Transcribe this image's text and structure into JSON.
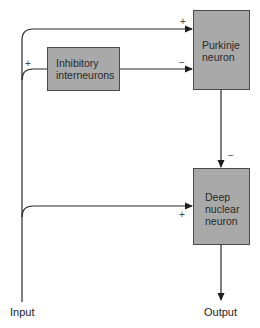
{
  "diagram": {
    "type": "cerebellar circuit block diagram",
    "nodes": {
      "inhibitory": {
        "line1": "Inhibitory",
        "line2": "interneurons"
      },
      "purkinje": {
        "line1": "Purkinje",
        "line2": "neuron"
      },
      "deep_nuclear": {
        "line1": "Deep",
        "line2": "nuclear",
        "line3": "neuron"
      }
    },
    "labels": {
      "input": "Input",
      "output": "Output"
    },
    "signs": {
      "input_to_purkinje": "+",
      "input_to_inhibitory": "+",
      "inhibitory_to_purkinje": "−",
      "purkinje_to_deep_nuclear": "−",
      "input_to_deep_nuclear": "+"
    },
    "edges": [
      {
        "from": "Input",
        "to": "Purkinje neuron",
        "sign": "+"
      },
      {
        "from": "Input",
        "to": "Inhibitory interneurons",
        "sign": "+"
      },
      {
        "from": "Inhibitory interneurons",
        "to": "Purkinje neuron",
        "sign": "−"
      },
      {
        "from": "Purkinje neuron",
        "to": "Deep nuclear neuron",
        "sign": "−"
      },
      {
        "from": "Input",
        "to": "Deep nuclear neuron",
        "sign": "+"
      },
      {
        "from": "Deep nuclear neuron",
        "to": "Output",
        "sign": ""
      }
    ],
    "colors": {
      "box_fill": "#a9a9a9",
      "box_border": "#4a4a4a",
      "line": "#2a2a2a"
    }
  }
}
